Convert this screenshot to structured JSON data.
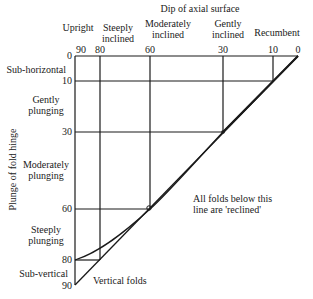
{
  "title": "Dip of axial surface",
  "y_axis_label": "Plunge of fold hinge",
  "dip_categories": [
    {
      "label_line1": "Upright",
      "label_line2": ""
    },
    {
      "label_line1": "Steeply",
      "label_line2": "inclined"
    },
    {
      "label_line1": "Moderately",
      "label_line2": "inclined"
    },
    {
      "label_line1": "Gently",
      "label_line2": "inclined"
    },
    {
      "label_line1": "Recumbent",
      "label_line2": ""
    }
  ],
  "dip_ticks": [
    "90",
    "80",
    "60",
    "30",
    "10",
    "0"
  ],
  "plunge_ticks": [
    "0",
    "10",
    "30",
    "60",
    "80",
    "90"
  ],
  "plunge_categories": [
    {
      "label_line1": "Sub-horizontal",
      "label_line2": ""
    },
    {
      "label_line1": "Gently",
      "label_line2": "plunging"
    },
    {
      "label_line1": "Moderately",
      "label_line2": "plunging"
    },
    {
      "label_line1": "Steeply",
      "label_line2": "plunging"
    },
    {
      "label_line1": "Sub-vertical",
      "label_line2": ""
    }
  ],
  "annotations": {
    "reclined_line1": "All folds below this",
    "reclined_line2": "line are 'reclined'",
    "vertical_folds": "Vertical folds"
  },
  "colors": {
    "line": "#1a1a1a",
    "background": "#ffffff"
  }
}
